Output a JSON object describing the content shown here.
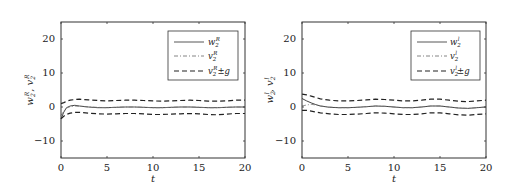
{
  "chart_data": [
    {
      "type": "line",
      "title": "",
      "xlabel": "t",
      "ylabel": "w_2^R, v_2^R",
      "xlim": [
        0,
        20
      ],
      "ylim": [
        -15,
        25
      ],
      "xticks": [
        0,
        5,
        10,
        15,
        20
      ],
      "yticks": [
        -10,
        0,
        10,
        20
      ],
      "grid": false,
      "legend_position": "upper right",
      "x": [
        0,
        0.3,
        0.6,
        1,
        1.5,
        2,
        3,
        4,
        5,
        6,
        7,
        8,
        9,
        10,
        11,
        12,
        13,
        14,
        15,
        16,
        17,
        18,
        19,
        20
      ],
      "series": [
        {
          "name": "w_2^R",
          "style": "solid",
          "values": [
            -3.5,
            -1.5,
            -0.2,
            0.3,
            0.5,
            0.3,
            0,
            -0.2,
            -0.2,
            -0.1,
            0,
            0,
            -0.1,
            -0.2,
            -0.2,
            -0.1,
            0,
            0,
            -0.1,
            -0.2,
            -0.2,
            -0.1,
            0,
            0
          ]
        },
        {
          "name": "v_2^R",
          "style": "dashdot",
          "values": [
            -2.5,
            -1.2,
            -0.3,
            0.1,
            0.3,
            0.2,
            0,
            -0.1,
            -0.2,
            -0.1,
            0,
            0,
            -0.1,
            -0.2,
            -0.2,
            -0.1,
            0,
            0,
            -0.1,
            -0.2,
            -0.2,
            -0.1,
            0,
            0
          ]
        },
        {
          "name": "v_2^R + g",
          "style": "dashed",
          "values": [
            1,
            1.3,
            1.7,
            2.0,
            2.2,
            2.3,
            2.1,
            1.9,
            1.8,
            1.9,
            2.0,
            2.0,
            1.9,
            1.8,
            1.7,
            1.8,
            1.9,
            2.0,
            1.9,
            1.7,
            1.7,
            1.8,
            2.0,
            2.0
          ]
        },
        {
          "name": "v_2^R - g",
          "style": "dashed",
          "values": [
            -3.5,
            -2.7,
            -2.2,
            -1.8,
            -1.6,
            -1.6,
            -1.8,
            -2.0,
            -2.1,
            -2.0,
            -1.9,
            -1.9,
            -2.0,
            -2.2,
            -2.2,
            -2.1,
            -2.0,
            -1.9,
            -2.0,
            -2.2,
            -2.3,
            -2.1,
            -1.9,
            -1.9
          ]
        }
      ],
      "legend": [
        "w_2^R",
        "v_2^R",
        "v_2^R ± g"
      ]
    },
    {
      "type": "line",
      "title": "",
      "xlabel": "t",
      "ylabel": "w_2^l, v_2^l",
      "xlim": [
        0,
        20
      ],
      "ylim": [
        -15,
        25
      ],
      "xticks": [
        0,
        5,
        10,
        15,
        20
      ],
      "yticks": [
        -10,
        0,
        10,
        20
      ],
      "grid": false,
      "legend_position": "upper right",
      "x": [
        0,
        0.5,
        1,
        1.5,
        2,
        3,
        4,
        5,
        6,
        7,
        8,
        9,
        10,
        11,
        12,
        13,
        14,
        15,
        16,
        17,
        18,
        19,
        20
      ],
      "series": [
        {
          "name": "w_2^l",
          "style": "solid",
          "values": [
            2.5,
            1.8,
            1.2,
            0.7,
            0.3,
            -0.1,
            -0.2,
            -0.2,
            -0.1,
            0.1,
            0.3,
            0.2,
            0,
            -0.2,
            -0.2,
            0,
            0.3,
            0.3,
            0,
            -0.3,
            -0.4,
            -0.2,
            0
          ]
        },
        {
          "name": "v_2^l",
          "style": "dashdot",
          "values": [
            0.3,
            0.6,
            0.8,
            0.6,
            0.3,
            0,
            -0.2,
            -0.2,
            -0.1,
            0.1,
            0.3,
            0.2,
            0,
            -0.2,
            -0.2,
            0,
            0.3,
            0.3,
            0,
            -0.3,
            -0.4,
            -0.2,
            0
          ]
        },
        {
          "name": "v_2^l + g",
          "style": "dashed",
          "values": [
            3.8,
            3.6,
            3.2,
            2.8,
            2.4,
            2.0,
            1.8,
            1.8,
            1.9,
            2.1,
            2.3,
            2.2,
            2.0,
            1.8,
            1.8,
            2.0,
            2.3,
            2.3,
            2.0,
            1.7,
            1.6,
            1.8,
            2.0
          ]
        },
        {
          "name": "v_2^l - g",
          "style": "dashed",
          "values": [
            -1.0,
            -1.0,
            -1.2,
            -1.5,
            -1.7,
            -2.0,
            -2.2,
            -2.2,
            -2.1,
            -1.9,
            -1.7,
            -1.8,
            -2.0,
            -2.2,
            -2.2,
            -2.0,
            -1.7,
            -1.7,
            -2.0,
            -2.3,
            -2.4,
            -2.2,
            -2.0
          ]
        }
      ],
      "legend": [
        "w_2^l",
        "v_2^l",
        "v_2^l ± g"
      ]
    }
  ],
  "panels": [
    {
      "ylabel_main": "w",
      "ylabel_sep": ", ",
      "ylabel_main2": "v",
      "sub": "2",
      "sup": "R",
      "xlabel": "t",
      "ytick_labels": [
        "20",
        "10",
        "0",
        "−10"
      ],
      "xtick_labels": [
        "0",
        "5",
        "10",
        "15",
        "20"
      ],
      "legend": [
        {
          "base": "w",
          "sub": "2",
          "sup": "R",
          "suffix": ""
        },
        {
          "base": "v",
          "sub": "2",
          "sup": "R",
          "suffix": ""
        },
        {
          "base": "v",
          "sub": "2",
          "sup": "R",
          "suffix": "±g"
        }
      ]
    },
    {
      "ylabel_main": "w",
      "ylabel_sep": ", ",
      "ylabel_main2": "v",
      "sub": "2",
      "sup": "l",
      "xlabel": "t",
      "ytick_labels": [
        "20",
        "10",
        "0",
        "−10"
      ],
      "xtick_labels": [
        "0",
        "5",
        "10",
        "15",
        "20"
      ],
      "legend": [
        {
          "base": "w",
          "sub": "2",
          "sup": "l",
          "suffix": ""
        },
        {
          "base": "v",
          "sub": "2",
          "sup": "l",
          "suffix": ""
        },
        {
          "base": "v",
          "sub": "2",
          "sup": "l",
          "suffix": "±g"
        }
      ]
    }
  ]
}
